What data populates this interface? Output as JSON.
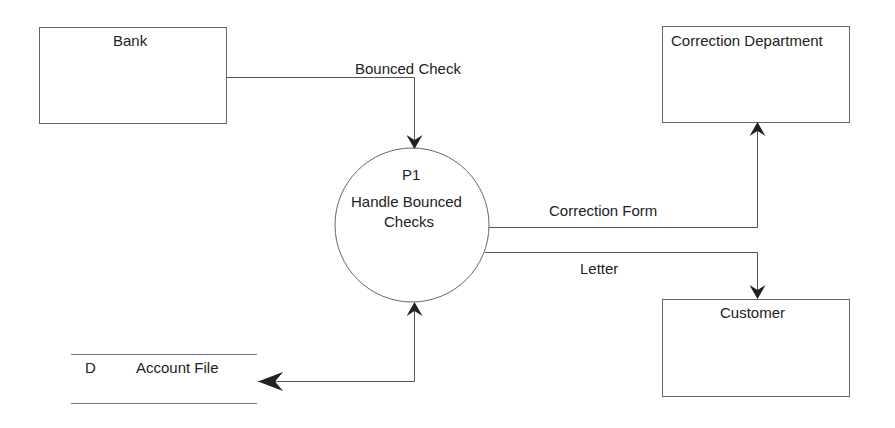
{
  "diagram": {
    "type": "data-flow-diagram",
    "colors": {
      "line": "#555555",
      "arrow": "#222222",
      "text": "#222222",
      "background": "#ffffff"
    },
    "entities": [
      {
        "id": "bank",
        "label": "Bank"
      },
      {
        "id": "correction_department",
        "label": "Correction Department"
      },
      {
        "id": "customer",
        "label": "Customer"
      }
    ],
    "process": {
      "id": "P1",
      "number": "P1",
      "label_line1": "Handle Bounced",
      "label_line2": "Checks"
    },
    "data_store": {
      "id_label": "D",
      "label": "Account File"
    },
    "flows": [
      {
        "from": "Bank",
        "to": "P1",
        "label": "Bounced Check"
      },
      {
        "from": "P1",
        "to": "Correction Department",
        "label": "Correction Form"
      },
      {
        "from": "P1",
        "to": "Customer",
        "label": "Letter"
      },
      {
        "from": "P1",
        "to": "Account File",
        "label": "",
        "bidirectional": true
      }
    ]
  }
}
